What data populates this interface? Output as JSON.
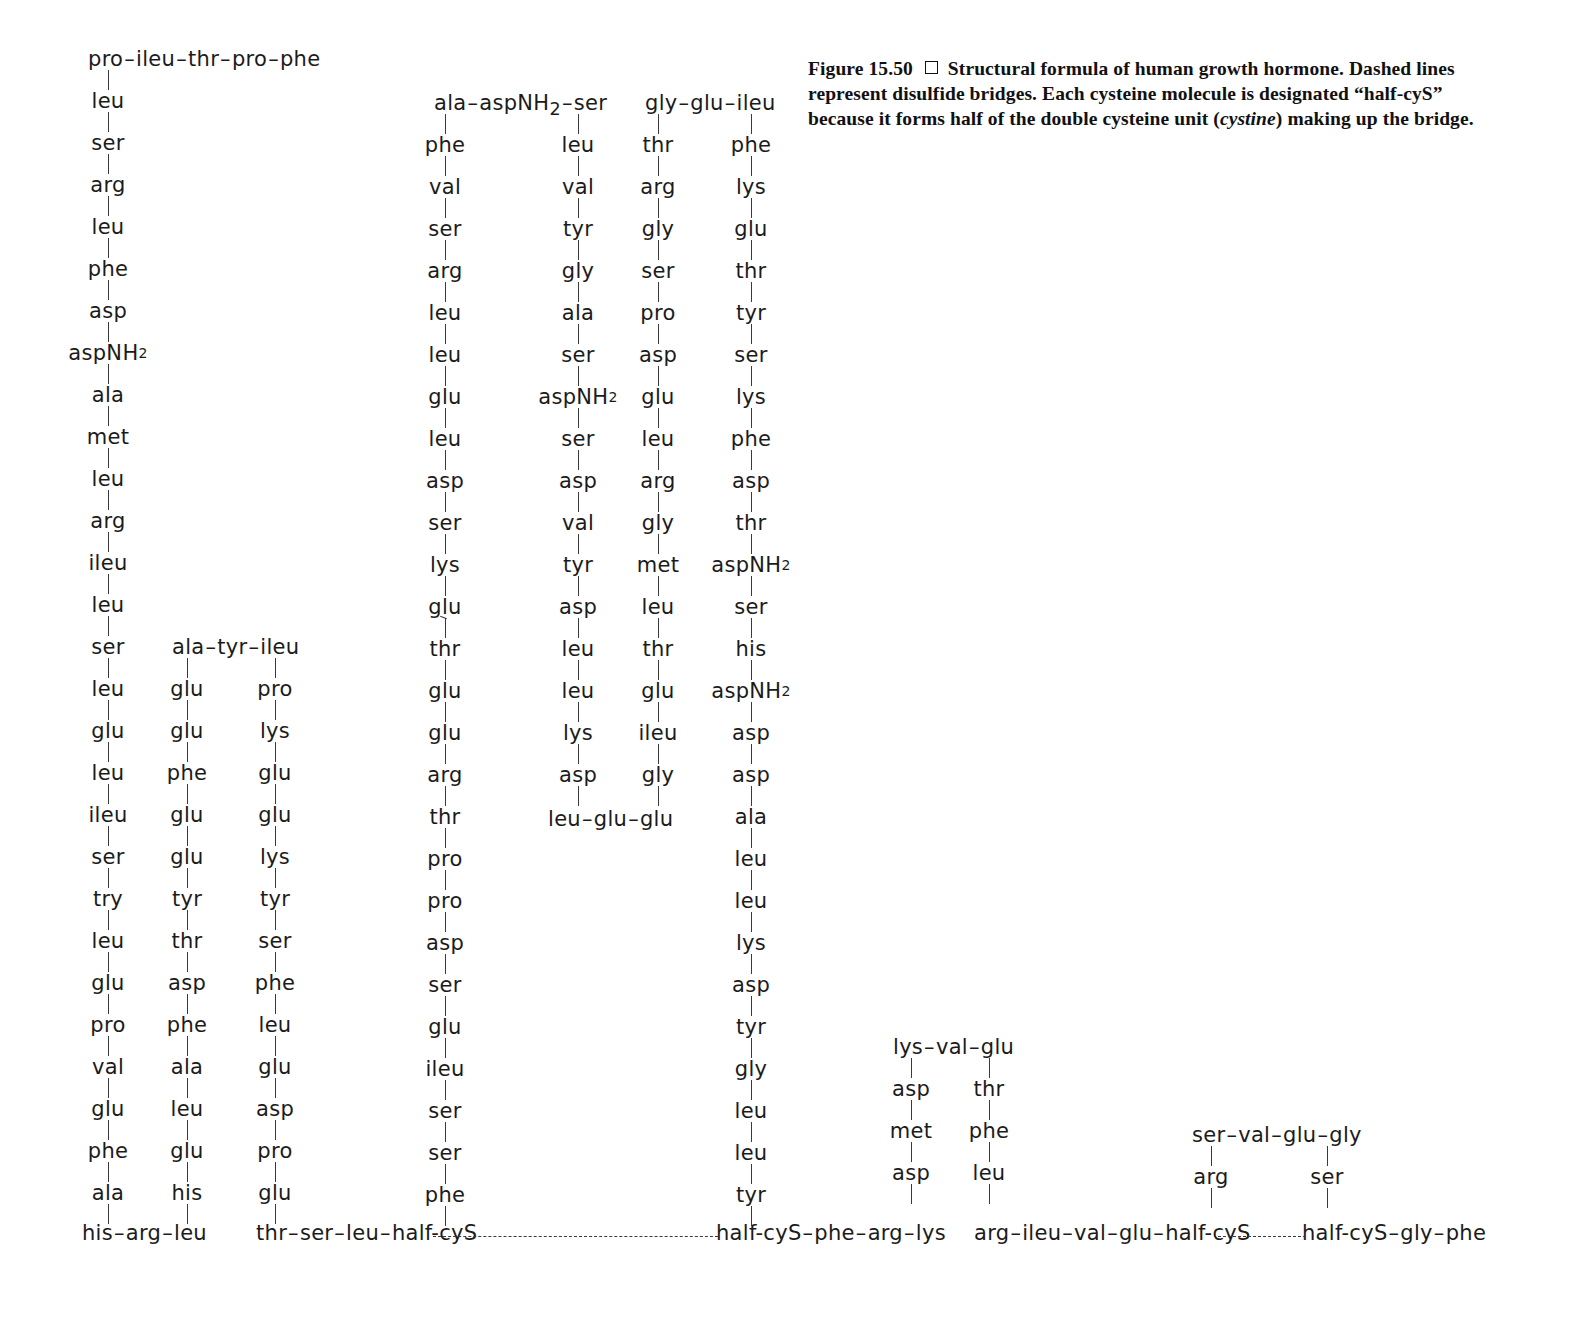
{
  "figure": {
    "label": "Figure 15.50",
    "marker": "square-bullet",
    "caption_line_1": "Structural formula of human growth hormone. Dashed lines",
    "caption_line_2a": "represent disulfide bridges. Each cysteine molecule is designated “half-cyS”",
    "caption_line_3a": "because it forms half of the double cysteine unit (",
    "caption_italic": "cystine",
    "caption_line_3b": ") making up the bridge."
  },
  "colors": {
    "ink": "#1b1b1b",
    "bond": "#3a3a3a",
    "background": "#ffffff"
  },
  "chains": {
    "top_run_1": [
      "pro",
      "ileu",
      "thr",
      "pro",
      "phe"
    ],
    "column_1": [
      "leu",
      "ser",
      "arg",
      "leu",
      "phe",
      "asp",
      "aspNH2",
      "ala",
      "met",
      "leu",
      "arg",
      "ileu",
      "leu",
      "ser",
      "leu",
      "glu",
      "leu",
      "ileu",
      "ser",
      "try",
      "leu",
      "glu",
      "pro",
      "val",
      "glu",
      "phe",
      "ala"
    ],
    "bottom_run_1": [
      "his",
      "arg",
      "leu"
    ],
    "top_run_2": [
      "ala",
      "tyr",
      "ileu"
    ],
    "column_2": [
      "glu",
      "glu",
      "phe",
      "glu",
      "glu",
      "tyr",
      "thr",
      "asp",
      "phe",
      "ala",
      "leu",
      "glu",
      "his"
    ],
    "column_3": [
      "pro",
      "lys",
      "glu",
      "glu",
      "lys",
      "tyr",
      "ser",
      "phe",
      "leu",
      "glu",
      "asp",
      "pro",
      "glu"
    ],
    "bottom_run_2": [
      "thr",
      "ser",
      "leu",
      "half-cyS"
    ],
    "top_run_3": [
      "ala",
      "aspNH2",
      "ser"
    ],
    "column_4": [
      "phe",
      "val",
      "ser",
      "arg",
      "leu",
      "leu",
      "glu",
      "leu",
      "asp",
      "ser",
      "lys",
      "glu",
      "thr",
      "glu",
      "glu",
      "arg",
      "thr",
      "pro",
      "pro",
      "asp",
      "ser",
      "glu",
      "ileu",
      "ser",
      "ser",
      "phe"
    ],
    "column_4_kink_after_index": 11,
    "column_5": [
      "leu",
      "val",
      "tyr",
      "gly",
      "ala",
      "ser",
      "aspNH2",
      "ser",
      "asp",
      "val",
      "tyr",
      "asp",
      "leu",
      "leu",
      "lys",
      "asp"
    ],
    "bottom_run_4": [
      "leu",
      "glu",
      "glu"
    ],
    "top_run_4": [
      "gly",
      "glu",
      "ileu"
    ],
    "column_6": [
      "thr",
      "arg",
      "gly",
      "ser",
      "pro",
      "asp",
      "glu",
      "leu",
      "arg",
      "gly",
      "met",
      "leu",
      "thr",
      "glu",
      "ileu",
      "gly"
    ],
    "column_7": [
      "phe",
      "lys",
      "glu",
      "thr",
      "tyr",
      "ser",
      "lys",
      "phe",
      "asp",
      "thr",
      "aspNH2",
      "ser",
      "his",
      "aspNH2",
      "asp",
      "asp",
      "ala",
      "leu",
      "leu",
      "lys",
      "asp",
      "tyr",
      "gly",
      "leu",
      "leu",
      "tyr"
    ],
    "bottom_run_5": [
      "half-cyS",
      "phe",
      "arg",
      "lys"
    ],
    "top_run_5": [
      "lys",
      "val",
      "glu"
    ],
    "column_8": [
      "asp",
      "met",
      "asp"
    ],
    "column_9": [
      "thr",
      "phe",
      "leu"
    ],
    "bottom_run_6": [
      "arg",
      "ileu",
      "val",
      "glu",
      "half-cyS"
    ],
    "top_run_6": [
      "ser",
      "val",
      "glu",
      "gly"
    ],
    "column_10": [
      "arg"
    ],
    "column_11": [
      "ser"
    ],
    "bottom_run_7": [
      "half-cyS",
      "gly",
      "phe"
    ]
  },
  "bridges": [
    {
      "name": "disulfide-bridge-left",
      "from": "half-cyS (thr-ser-leu-half-cyS)",
      "to": "half-cyS (half-cyS-phe-arg-lys)"
    },
    {
      "name": "disulfide-bridge-right",
      "from": "half-cyS (arg-ileu-val-glu-half-cyS)",
      "to": "half-cyS (half-cyS-gly-phe)"
    }
  ]
}
